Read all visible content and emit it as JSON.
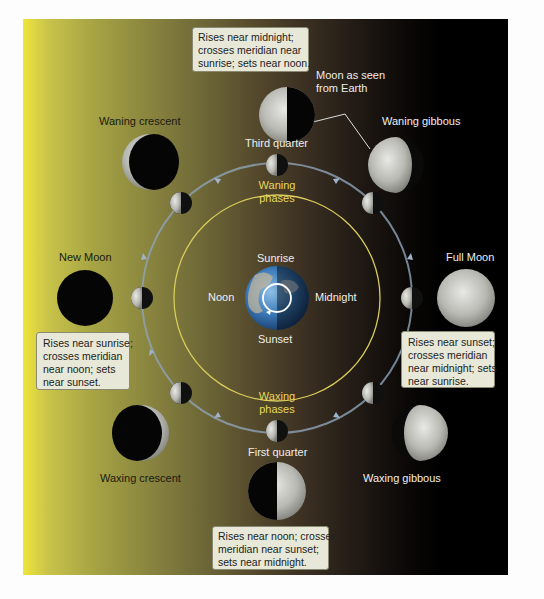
{
  "diagram": {
    "colors": {
      "sunlit_side": "#f0e53a",
      "dark_side": "#000000",
      "inner_orbit": "#d8cc5a",
      "outer_orbit": "#8fa3b8",
      "phase_text": "#e6d85a",
      "callout_bg": "#e7e8d8"
    },
    "earth": {
      "labels": {
        "top": "Sunrise",
        "left": "Noon",
        "right": "Midnight",
        "bottom": "Sunset"
      }
    },
    "inner_orbit_labels": {
      "waning": [
        "Waning",
        "phases"
      ],
      "waxing": [
        "Waxing",
        "phases"
      ]
    },
    "annotation": {
      "lines": [
        "Moon as seen",
        "from Earth"
      ]
    },
    "phases": [
      {
        "name": "New Moon",
        "appearance": "fully dark"
      },
      {
        "name": "Waxing crescent",
        "appearance": "thin lit crescent on right"
      },
      {
        "name": "First quarter",
        "appearance": "right half lit"
      },
      {
        "name": "Waxing gibbous",
        "appearance": "mostly lit, dark left edge"
      },
      {
        "name": "Full Moon",
        "appearance": "fully lit"
      },
      {
        "name": "Waning gibbous",
        "appearance": "mostly lit, dark right edge"
      },
      {
        "name": "Third quarter",
        "appearance": "left half lit"
      },
      {
        "name": "Waning crescent",
        "appearance": "thin lit crescent on left"
      }
    ],
    "callouts": {
      "new_moon": [
        "Rises near sunrise;",
        "crosses meridian",
        "near noon; sets",
        "near sunset."
      ],
      "first_quarter": [
        "Rises near noon; crosses",
        "meridian near sunset;",
        "sets near midnight."
      ],
      "full_moon": [
        "Rises near sunset;",
        "crosses meridian",
        "near midnight; sets",
        "near sunrise."
      ],
      "third_quarter": [
        "Rises near midnight;",
        "crosses meridian near",
        "sunrise; sets near noon."
      ]
    }
  }
}
